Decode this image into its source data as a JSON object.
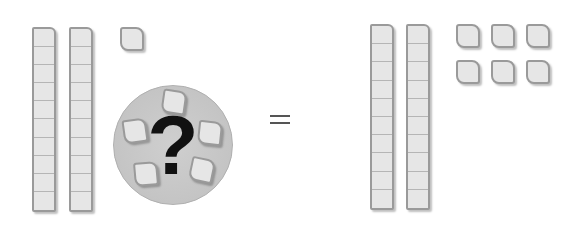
{
  "diagram": {
    "left_side": {
      "ten_rods": 2,
      "unit_cubes": 1,
      "unknown": {
        "symbol": "?",
        "cubes_shown_in_circle": 5
      }
    },
    "operator": "=",
    "right_side": {
      "ten_rods": 2,
      "unit_cubes": 6
    },
    "colors": {
      "block_fill": "#e6e6e6",
      "block_border": "#9a9a9a",
      "circle_fill": "#c8c8c8",
      "question_mark": "#111111"
    }
  }
}
